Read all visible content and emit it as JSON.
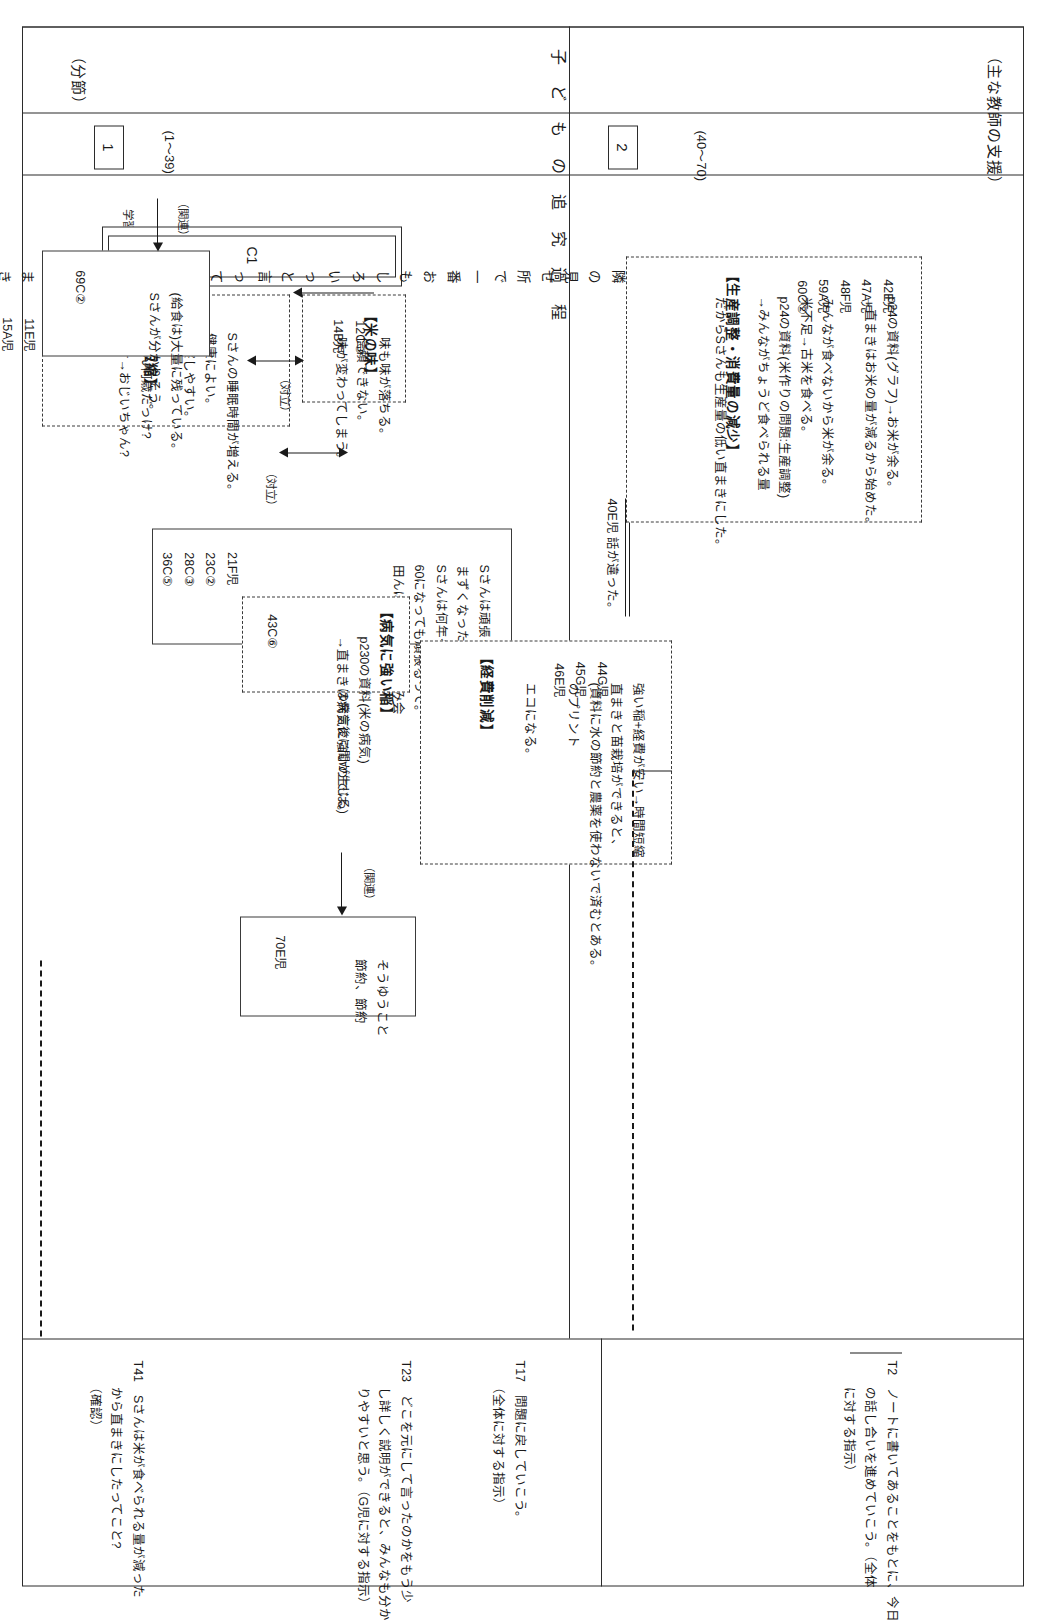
{
  "page": {
    "columns": [
      {
        "id": "segment",
        "header": "（分節）"
      },
      {
        "id": "process",
        "header": "子 ど も の 追 究 過 程"
      },
      {
        "id": "support",
        "header": "（主な教師の支援）"
      }
    ],
    "process_header_paren_open": "（",
    "process_header_paren_close": "）"
  },
  "segments": [
    {
      "no": "1",
      "range": "(1～39)"
    },
    {
      "no": "2",
      "range": "(40～70)"
    }
  ],
  "learning_problem": {
    "caption": "学習問題の確認",
    "marker": "C1",
    "line1": "Sさんは苗作りが隣の見せ所で一番おもしろいっと言っていたのに何で",
    "line2": "直まきをやり始めた理由は何だろう?"
  },
  "blocks": [
    {
      "id": "jikan-tanshuku",
      "title": "【時間短縮】",
      "ids": [
        "5A児",
        "7E児",
        "11E児",
        "15A児"
      ],
      "lines": [
        "Sさんの睡眠時間が増える。",
        "健康によい。",
        "観察しやすい。",
        "",
        "Sさん何歳だっけ?",
        "54才→おじいちゃん?"
      ]
    },
    {
      "id": "kome-no-aji",
      "title": "【米の味】",
      "ids": [
        "12C③",
        "14B児"
      ],
      "lines": [
        "味も味が落ちる。",
        "信頼できない。",
        "味が変わってしまう。"
      ]
    },
    {
      "id": "hanron",
      "ids": [
        "21F児",
        "23C②",
        "28C③",
        "36C⑤"
      ],
      "lines": [
        "Sさんは頑張っていない訳じゃない。",
        "まずくなったら直まきをするわけじゃない。",
        "Sさんは何年やっても一生懸命。",
        "60になっても頑張るって。",
        "田んぼの仕事+夜は飲み会"
      ],
      "footnote": "(39E児の発言後に間が生じる)"
    },
    {
      "id": "seisan-chosei",
      "title": "【生産調整・消費量の減少】",
      "ids": [
        "42E児",
        "47A児",
        "48F児",
        "59A児",
        "60C②"
      ],
      "lines": [
        "p24の資料(グラフ)→お米が余る。",
        "→直まきはお米の量が減るから始めた。",
        "",
        "みんなが食べないから米が余る。",
        "米不足→古米を食べる。",
        "p24の資料(米作りの問題:生産調整)",
        "→みんながちょうど食べられる量",
        "",
        "だからSさんも生産量の低い直まきにした。"
      ]
    },
    {
      "id": "byouki",
      "title": "【病気に強い稲】",
      "ids": [
        "43C⑥"
      ],
      "lines": [
        "p230の資料(米の病気)",
        "→直まきは病気に強いのでは。"
      ]
    },
    {
      "id": "keihi-sakugen",
      "title": "【経費削減】",
      "ids": [
        "44G児",
        "45G児",
        "46E児"
      ],
      "lines": [
        "強い稲+経費が安い→時間短縮",
        "直まきと苗栽培ができると、",
        "(資料に水の節約と農薬を使わないで済むとある。",
        "のプリント",
        "",
        "エコになる。"
      ]
    },
    {
      "id": "kyuushoku",
      "ids": [
        "69C②"
      ],
      "lines": [
        "(給食は)大量に残っている。",
        "Sさんが分かりそう。"
      ]
    },
    {
      "id": "matome",
      "ids": [
        "70E児"
      ],
      "lines": [
        "そうゆうこと",
        "節約、節約"
      ]
    }
  ],
  "connectors": [
    {
      "id": "tairitsu-1",
      "label": "（対立）"
    },
    {
      "id": "tairitsu-2",
      "label": "（対立）"
    },
    {
      "id": "kanren-1",
      "label": "（関連）"
    },
    {
      "id": "kanren-2",
      "label": "（関連）"
    }
  ],
  "transition_note": {
    "id": "40E",
    "text": "40E児 話が違った。"
  },
  "support": [
    {
      "id": "T2",
      "lines": [
        "ノートに書いてあることをもとに、今日",
        "の話し合いを進めていこう。（全体",
        "に対する指示）"
      ]
    },
    {
      "id": "T17",
      "lines": [
        "問題に戻していこう。",
        "（全体に対する指示）"
      ]
    },
    {
      "id": "T23",
      "lines": [
        "どこを元にして言ったのかをもう少",
        "し詳しく説明ができると、みんなも分か",
        "りやすいと思う。（G児に対する指示）"
      ]
    },
    {
      "id": "T41",
      "lines": [
        "Sさんは米が食べられる量が減った",
        "から直まきにしたってこと?",
        "（確認）"
      ]
    }
  ]
}
